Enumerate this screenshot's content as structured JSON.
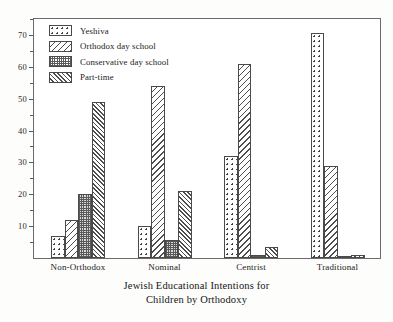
{
  "chart_data": {
    "type": "bar",
    "title": "Jewish Educational Intentions for Children by Orthodoxy",
    "title_lines": [
      "Jewish Educational Intentions for",
      "Children by Orthodoxy"
    ],
    "xlabel": "",
    "ylabel": "",
    "ylim": [
      0,
      75
    ],
    "ytick_labels": [
      "10",
      "20",
      "30",
      "40",
      "50",
      "60",
      "70"
    ],
    "ytick_values": [
      10,
      20,
      30,
      40,
      50,
      60,
      70
    ],
    "yminor_values": [
      5,
      15,
      25,
      35,
      45,
      55,
      65,
      75
    ],
    "grid": false,
    "legend_position": "top-left",
    "categories": [
      "Non-Orthodox",
      "Nominal",
      "Centrist",
      "Traditional"
    ],
    "series": [
      {
        "name": "Yeshiva",
        "pattern": "sparse-dots",
        "values": [
          7,
          10,
          32,
          70.5
        ]
      },
      {
        "name": "Orthodox day school",
        "pattern": "back-hatch",
        "values": [
          12,
          54,
          61,
          29
        ]
      },
      {
        "name": "Conservative day school",
        "pattern": "dense-checker",
        "values": [
          20,
          5.5,
          1,
          0.6
        ]
      },
      {
        "name": "Part-time",
        "pattern": "forward-hatch",
        "values": [
          49,
          21,
          3.5,
          1
        ]
      }
    ]
  },
  "legend": {
    "items": [
      {
        "label": "Yeshiva"
      },
      {
        "label": "Orthodox day school"
      },
      {
        "label": "Conservative day school"
      },
      {
        "label": "Part-time"
      }
    ]
  },
  "axes": {
    "y_labels": [
      "70",
      "60",
      "50",
      "40",
      "30",
      "20",
      "10"
    ],
    "x_labels": [
      "Non-Orthodox",
      "Nominal",
      "Centrist",
      "Traditional"
    ]
  },
  "title": {
    "line1": "Jewish Educational Intentions for",
    "line2": "Children by Orthodoxy"
  },
  "colors": {
    "background": "#fdfdfb",
    "plot_background": "#ffffff",
    "frame": "#6b6b6b",
    "bar_outline": "#4a4a4a",
    "text": "#1b1b1b"
  }
}
